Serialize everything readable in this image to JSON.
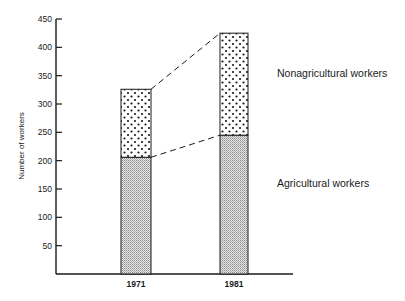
{
  "chart_data": {
    "type": "bar",
    "stacked": true,
    "title": "",
    "xlabel": "",
    "ylabel": "Number of workers",
    "ylim": [
      0,
      450
    ],
    "yticks": [
      50,
      100,
      150,
      200,
      250,
      300,
      350,
      400,
      450
    ],
    "categories": [
      "1971",
      "1981"
    ],
    "series": [
      {
        "name": "Agricultural workers",
        "values": [
          206,
          245
        ],
        "pattern": "fine-stipple"
      },
      {
        "name": "Nonagricultural workers",
        "values": [
          120,
          180
        ],
        "pattern": "dots"
      }
    ],
    "totals": [
      326,
      425
    ],
    "connector_lines": "dashed",
    "grid": false,
    "legend_position": "right, inline labels"
  },
  "labels": {
    "ylabel": "Number of workers",
    "legend_nonagri": "Nonagricultural workers",
    "legend_agri": "Agricultural workers",
    "cat_0": "1971",
    "cat_1": "1981"
  },
  "colors": {
    "ink": "#1a1a1a",
    "stipple_bg": "#d9d9d9",
    "background": "#ffffff"
  }
}
